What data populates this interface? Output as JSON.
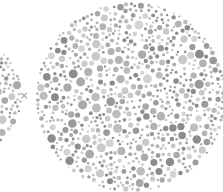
{
  "separator": {
    "symbol": "×",
    "color": "#9a9a9a"
  },
  "plates": [
    {
      "name": "left-plate",
      "cx": -38,
      "cy": 96,
      "r": 60,
      "seed": 7
    },
    {
      "name": "right-plate",
      "cx": 131,
      "cy": 97,
      "r": 95,
      "seed": 42
    }
  ],
  "dot_palette": [
    "#bdbdbd",
    "#c9c9c9",
    "#a9a9a9",
    "#9a9a9a",
    "#8c8c8c",
    "#d3d3d3",
    "#b3b3b3"
  ],
  "dot_size_range": [
    1.2,
    4.6
  ]
}
